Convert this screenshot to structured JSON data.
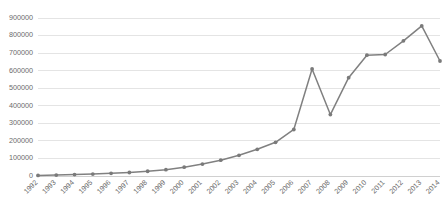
{
  "chart_data": {
    "type": "line",
    "title": "",
    "subtitle": "",
    "xlabel": "",
    "ylabel": "",
    "categories": [
      "1992",
      "1993",
      "1994",
      "1995",
      "1996",
      "1997",
      "1998",
      "1999",
      "2000",
      "2001",
      "2002",
      "2003",
      "2004",
      "2005",
      "2006",
      "2007",
      "2008",
      "2009",
      "2010",
      "2011",
      "2012",
      "2013",
      "2014"
    ],
    "values": [
      3000,
      5000,
      8000,
      11000,
      15000,
      20000,
      27000,
      36000,
      50000,
      68000,
      90000,
      118000,
      152000,
      192000,
      265000,
      610000,
      350000,
      560000,
      688000,
      692000,
      770000,
      855000,
      655000
    ],
    "ylim": [
      0,
      900000
    ],
    "ytick_values": [
      0,
      100000,
      200000,
      300000,
      400000,
      500000,
      600000,
      700000,
      800000,
      900000
    ],
    "ytick_labels": [
      "0",
      "100000",
      "200000",
      "300000",
      "400000",
      "500000",
      "600000",
      "700000",
      "800000",
      "900000"
    ],
    "grid": "horizontal",
    "legend": "none",
    "series": [
      {
        "name": "series-1",
        "color": "#808080",
        "marker": "circle",
        "values": [
          3000,
          5000,
          8000,
          11000,
          15000,
          20000,
          27000,
          36000,
          50000,
          68000,
          90000,
          118000,
          152000,
          192000,
          265000,
          610000,
          350000,
          560000,
          688000,
          692000,
          770000,
          855000,
          655000
        ]
      }
    ],
    "colors": {
      "line": "#808080",
      "marker": "#7a7a7a",
      "grid": "#e4e4e4",
      "axis": "#d0d0d0",
      "tick_text": "#6b6b6b",
      "background": "#ffffff"
    },
    "xtick_rotation": -45
  }
}
